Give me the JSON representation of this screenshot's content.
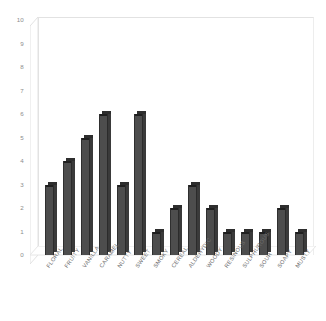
{
  "chart_data": {
    "type": "bar",
    "title": "",
    "subtitle": "",
    "xlabel": "",
    "ylabel": "",
    "ylim": [
      0,
      10
    ],
    "yticks": [
      10,
      9,
      8,
      7,
      6,
      5,
      4,
      3,
      2,
      1,
      0
    ],
    "grid": false,
    "legend": null,
    "style": "3d-column",
    "bar_color": "#4d4d4d",
    "bar_edge_color": "#2e2e2e",
    "plot_frame_color": "#e2e2e2",
    "tick_label_color": "#8c8c8c",
    "categories": [
      "FLORAL",
      "FRUITY",
      "VANILLA",
      "CARAMEL",
      "NUTTY",
      "SWEET",
      "SMOKY",
      "CEREAL",
      "ALDEHYDIC",
      "WOODY",
      "RESINOUS",
      "SULPHUROUS",
      "SOUR",
      "SOAPY",
      "MUSTY"
    ],
    "values": [
      3,
      4,
      5,
      6,
      3,
      6,
      1,
      2,
      3,
      2,
      1,
      1,
      1,
      2,
      1
    ]
  }
}
